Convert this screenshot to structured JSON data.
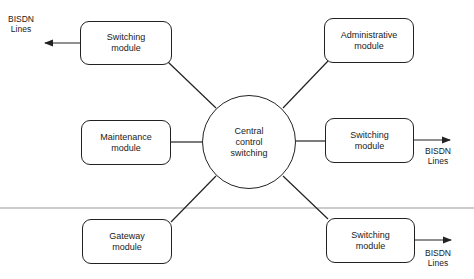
{
  "diagram": {
    "center": {
      "lines": [
        "Central",
        "control",
        "switching"
      ]
    },
    "modules": [
      {
        "id": "switching-top-left",
        "lines": [
          "Switching",
          "module"
        ]
      },
      {
        "id": "administrative",
        "lines": [
          "Administrative",
          "module"
        ]
      },
      {
        "id": "maintenance",
        "lines": [
          "Maintenance",
          "module"
        ]
      },
      {
        "id": "switching-right",
        "lines": [
          "Switching",
          "module"
        ]
      },
      {
        "id": "gateway",
        "lines": [
          "Gateway",
          "module"
        ]
      },
      {
        "id": "switching-bottom-right",
        "lines": [
          "Switching",
          "module"
        ]
      }
    ],
    "external_labels": [
      {
        "id": "bisdn-top-left",
        "lines": [
          "BISDN",
          "Lines"
        ]
      },
      {
        "id": "bisdn-right",
        "lines": [
          "BISDN",
          "Lines"
        ]
      },
      {
        "id": "bisdn-bottom-right",
        "lines": [
          "BISDN",
          "Lines"
        ]
      }
    ],
    "colors": {
      "stroke": "#222222",
      "divider": "#999999",
      "background": "#ffffff"
    }
  }
}
